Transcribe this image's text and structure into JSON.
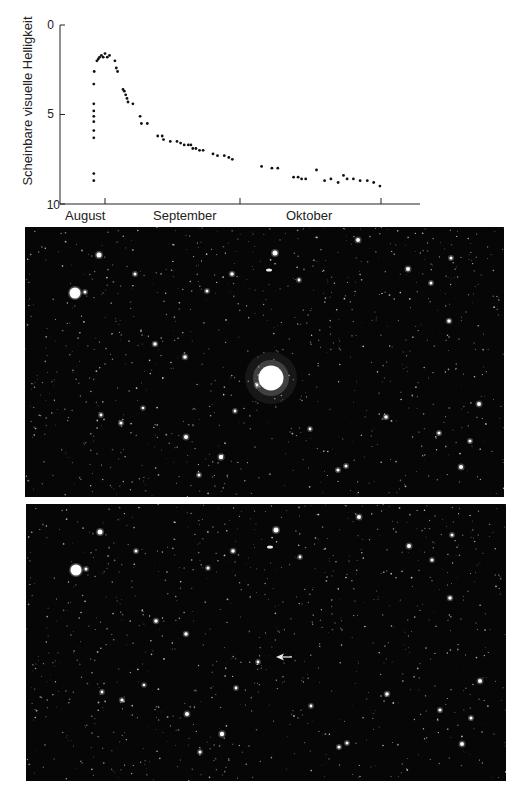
{
  "chart_data": {
    "type": "scatter",
    "title": "",
    "xlabel": "",
    "ylabel": "Scheinbare visuelle Helligkeit",
    "y_inverted": true,
    "ylim": [
      0,
      10
    ],
    "yticks": [
      0,
      5,
      10
    ],
    "ytick_labels": [
      "0",
      "5",
      "10"
    ],
    "x_month_labels": [
      "August",
      "September",
      "Oktober"
    ],
    "x_unit": "days since 1 August (approx.)",
    "xlim": [
      0,
      92
    ],
    "grid": false,
    "legend": null,
    "series": [
      {
        "name": "Nova brightness",
        "points": [
          [
            28.5,
            8.7
          ],
          [
            28.5,
            8.3
          ],
          [
            28.5,
            6.3
          ],
          [
            28.5,
            5.9
          ],
          [
            28.5,
            5.4
          ],
          [
            28.5,
            5.1
          ],
          [
            28.5,
            4.8
          ],
          [
            28.5,
            4.4
          ],
          [
            28.5,
            3.3
          ],
          [
            28.6,
            2.6
          ],
          [
            29.2,
            2.0
          ],
          [
            29.5,
            1.9
          ],
          [
            29.8,
            1.8
          ],
          [
            30.2,
            1.7
          ],
          [
            30.6,
            1.8
          ],
          [
            31.0,
            1.6
          ],
          [
            31.5,
            1.8
          ],
          [
            32.0,
            1.7
          ],
          [
            33.2,
            2.0
          ],
          [
            33.5,
            2.4
          ],
          [
            33.8,
            2.6
          ],
          [
            35.0,
            3.6
          ],
          [
            35.3,
            3.7
          ],
          [
            35.6,
            3.9
          ],
          [
            35.9,
            4.1
          ],
          [
            36.1,
            4.3
          ],
          [
            37.2,
            4.4
          ],
          [
            38.8,
            5.1
          ],
          [
            39.1,
            5.5
          ],
          [
            40.4,
            5.5
          ],
          [
            42.7,
            6.2
          ],
          [
            43.7,
            6.2
          ],
          [
            44.0,
            6.4
          ],
          [
            45.5,
            6.5
          ],
          [
            47.0,
            6.5
          ],
          [
            47.8,
            6.6
          ],
          [
            48.6,
            6.7
          ],
          [
            49.5,
            6.7
          ],
          [
            50.1,
            6.7
          ],
          [
            50.5,
            6.9
          ],
          [
            51.2,
            6.9
          ],
          [
            52.0,
            7.0
          ],
          [
            52.8,
            7.0
          ],
          [
            55.0,
            7.2
          ],
          [
            56.0,
            7.3
          ],
          [
            57.5,
            7.3
          ],
          [
            58.5,
            7.4
          ],
          [
            59.3,
            7.5
          ],
          [
            65.8,
            7.9
          ],
          [
            68.1,
            8.0
          ],
          [
            69.4,
            8.0
          ],
          [
            72.9,
            8.5
          ],
          [
            73.9,
            8.5
          ],
          [
            74.7,
            8.6
          ],
          [
            75.6,
            8.6
          ],
          [
            78.0,
            8.1
          ],
          [
            79.8,
            8.7
          ],
          [
            81.2,
            8.6
          ],
          [
            82.8,
            8.8
          ],
          [
            84.0,
            8.4
          ],
          [
            84.8,
            8.6
          ],
          [
            86.2,
            8.6
          ],
          [
            87.7,
            8.7
          ],
          [
            89.3,
            8.7
          ],
          [
            90.7,
            8.8
          ],
          [
            92.1,
            9.0
          ]
        ]
      }
    ]
  },
  "photos": [
    {
      "name": "before-photo",
      "caption": ""
    },
    {
      "name": "after-photo",
      "caption": "",
      "marker": "arrow"
    }
  ]
}
